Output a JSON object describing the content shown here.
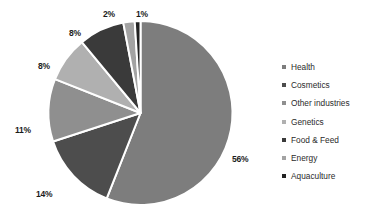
{
  "chart_data": {
    "type": "pie",
    "title": "",
    "labels": [
      "Health",
      "Cosmetics",
      "Other industries",
      "Genetics",
      "Food & Feed",
      "Energy",
      "Aquaculture"
    ],
    "values": [
      56,
      14,
      11,
      8,
      8,
      2,
      1
    ],
    "value_labels": [
      "56%",
      "14%",
      "11%",
      "8%",
      "8%",
      "2%",
      "1%"
    ],
    "colors": [
      "#7d7d7d",
      "#4d4d4d",
      "#8f8f8f",
      "#b0b0b0",
      "#3a3a3a",
      "#a3a3a3",
      "#222222"
    ],
    "legend_position": "right",
    "grid": false,
    "start_angle_deg": 0,
    "direction": "clockwise",
    "slice_border_color": "#ffffff",
    "background": "#ffffff"
  },
  "legend": {
    "items": [
      {
        "label": "Health",
        "color": "#7d7d7d"
      },
      {
        "label": "Cosmetics",
        "color": "#4d4d4d"
      },
      {
        "label": "Other industries",
        "color": "#8f8f8f"
      },
      {
        "label": "Genetics",
        "color": "#b0b0b0"
      },
      {
        "label": "Food & Feed",
        "color": "#3a3a3a"
      },
      {
        "label": "Energy",
        "color": "#a3a3a3"
      },
      {
        "label": "Aquaculture",
        "color": "#222222"
      }
    ]
  },
  "pie_labels": [
    {
      "text": "56%",
      "x": 232,
      "y": 155
    },
    {
      "text": "14%",
      "x": 36,
      "y": 190
    },
    {
      "text": "11%",
      "x": 15,
      "y": 126
    },
    {
      "text": "8%",
      "x": 38,
      "y": 62
    },
    {
      "text": "8%",
      "x": 69,
      "y": 29
    },
    {
      "text": "2%",
      "x": 103,
      "y": 10
    },
    {
      "text": "1%",
      "x": 136,
      "y": 10
    }
  ]
}
